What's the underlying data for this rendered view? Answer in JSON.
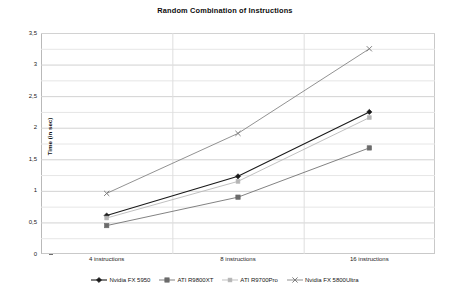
{
  "chart_data": {
    "type": "line",
    "title": "Random Combination of Instructions",
    "xlabel": "",
    "ylabel": "Time (in sec)",
    "categories": [
      "4 instructions",
      "8 instructions",
      "16 instructions"
    ],
    "ylim": [
      0,
      3.5
    ],
    "ytick_step": 0.5,
    "ytick_labels": [
      "0",
      "0,5",
      "1",
      "1,5",
      "2",
      "2,5",
      "3",
      "3,5"
    ],
    "ytick_values": [
      0,
      0.5,
      1,
      1.5,
      2,
      2.5,
      3,
      3.5
    ],
    "minor_gridline_step": 0.25,
    "grid": true,
    "legend_position": "bottom",
    "series": [
      {
        "name": "Nvidia FX 5950",
        "values": [
          0.61,
          1.23,
          2.25
        ],
        "color": "#1a1a1a",
        "marker": "diamond"
      },
      {
        "name": "ATI R9800XT",
        "values": [
          0.45,
          0.9,
          1.68
        ],
        "color": "#6b6b6b",
        "marker": "square"
      },
      {
        "name": "ATI R9700Pro",
        "values": [
          0.57,
          1.15,
          2.16
        ],
        "color": "#b5b5b5",
        "marker": "square-small"
      },
      {
        "name": "Nvidia FX 5800Ultra",
        "values": [
          0.96,
          1.91,
          3.25
        ],
        "color": "#7e7e7e",
        "marker": "cross"
      }
    ]
  }
}
